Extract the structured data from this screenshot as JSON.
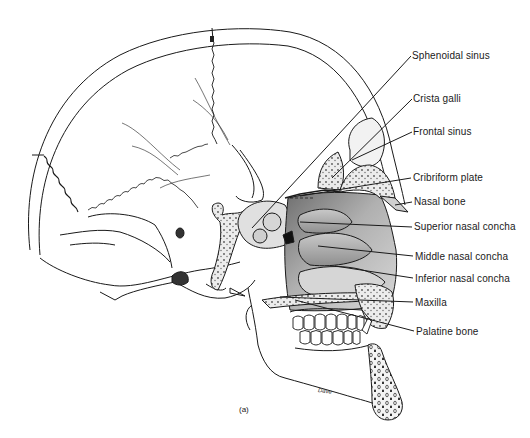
{
  "figure": {
    "caption": "(a)",
    "signature": "Dave"
  },
  "labels": [
    {
      "id": "sphenoidal-sinus",
      "text": "Sphenoidal sinus",
      "x": 412,
      "y": 50
    },
    {
      "id": "crista-galli",
      "text": "Crista galli",
      "x": 413,
      "y": 93
    },
    {
      "id": "frontal-sinus",
      "text": "Frontal sinus",
      "x": 413,
      "y": 126
    },
    {
      "id": "cribriform-plate",
      "text": "Cribriform plate",
      "x": 413,
      "y": 172
    },
    {
      "id": "nasal-bone",
      "text": "Nasal bone",
      "x": 414,
      "y": 196
    },
    {
      "id": "superior-nasal-concha",
      "text": "Superior nasal concha",
      "x": 414,
      "y": 221
    },
    {
      "id": "middle-nasal-concha",
      "text": "Middle nasal concha",
      "x": 415,
      "y": 251
    },
    {
      "id": "inferior-nasal-concha",
      "text": "Inferior nasal concha",
      "x": 415,
      "y": 273
    },
    {
      "id": "maxilla",
      "text": "Maxilla",
      "x": 415,
      "y": 297
    },
    {
      "id": "palatine-bone",
      "text": "Palatine bone",
      "x": 416,
      "y": 326
    }
  ],
  "colors": {
    "line": "#1a1a1a",
    "shade_dark": "#8a8a8a",
    "shade_mid": "#b5b5b5",
    "shade_light": "#dcdcdc",
    "bone_fill": "#e8e8e8"
  }
}
